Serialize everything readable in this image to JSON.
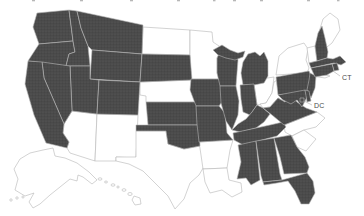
{
  "map": {
    "region": "United States choropleth",
    "labels": {
      "ct": "CT",
      "dc": "DC"
    },
    "filled_states": [
      "WA",
      "OR",
      "CA",
      "NV",
      "ID",
      "MT",
      "WY",
      "UT",
      "CO",
      "SD",
      "KS",
      "OK",
      "IA",
      "MO",
      "WI",
      "MI",
      "IL",
      "IN",
      "KY",
      "TN",
      "MS",
      "AL",
      "GA",
      "FL",
      "VA",
      "MD",
      "DE",
      "DC",
      "NJ",
      "PA",
      "CT",
      "RI",
      "MA",
      "NH"
    ],
    "empty_states": [
      "ME",
      "VT",
      "NY",
      "OH",
      "WV",
      "NC",
      "SC",
      "MN",
      "ND",
      "NE",
      "TX",
      "AR",
      "LA",
      "AZ",
      "NM",
      "AK",
      "HI"
    ],
    "colors": {
      "filled": "#4a4a4a",
      "texture_light": "#5c5c5c",
      "texture_dark": "#3f3f3f",
      "empty": "#ffffff",
      "border": "#b5b5b5",
      "label": "#4a4a4a",
      "leader": "#9a9a9a",
      "fragment": "#9a9a9a"
    }
  }
}
